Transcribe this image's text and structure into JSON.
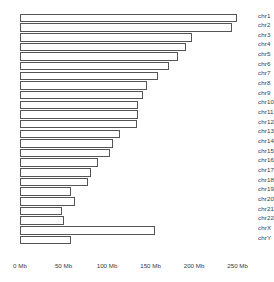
{
  "chart_data": {
    "type": "bar",
    "orientation": "horizontal",
    "title": "",
    "subtitle": "",
    "xlabel": "",
    "ylabel": "",
    "xlim": [
      0,
      270
    ],
    "grid": false,
    "legend": false,
    "unit": "Mb",
    "xticks": [
      0,
      50,
      100,
      150,
      200,
      250
    ],
    "xtick_labels": [
      "0 Mb",
      "50 Mb",
      "100 Mb",
      "150 Mb",
      "200 Mb",
      "250 Mb"
    ],
    "categories": [
      "chr1",
      "chr2",
      "chr3",
      "chr4",
      "chr5",
      "chr6",
      "chr7",
      "chr8",
      "chr9",
      "chr10",
      "chr11",
      "chr12",
      "chr13",
      "chr14",
      "chr15",
      "chr16",
      "chr17",
      "chr18",
      "chr19",
      "chr20",
      "chr21",
      "chr22",
      "chrX",
      "chrY"
    ],
    "values": [
      249,
      243,
      198,
      191,
      181,
      171,
      159,
      146,
      141,
      136,
      135,
      134,
      115,
      107,
      103,
      90,
      81,
      78,
      59,
      63,
      48,
      51,
      155,
      59
    ],
    "bar_fill": "#ffffff",
    "bar_stroke": "#555555",
    "background": "#ffffff",
    "text_color": "#3a3a3a"
  }
}
